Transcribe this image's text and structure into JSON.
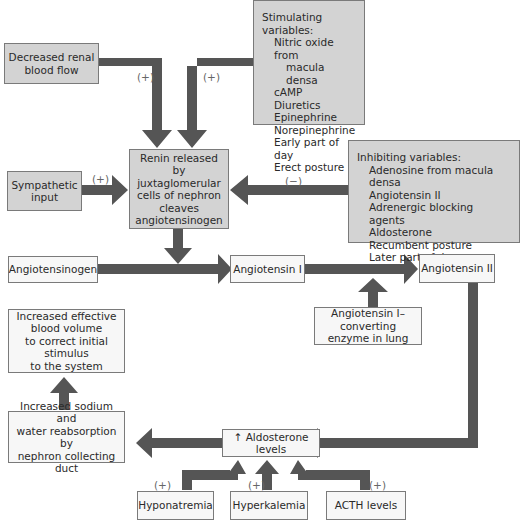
{
  "diagram": {
    "nodes": {
      "decreased_renal_blood_flow": "Decreased renal\nblood flow",
      "stimulating": {
        "heading": "Stimulating variables:",
        "items": [
          "Nitric oxide from",
          "macula densa",
          "cAMP",
          "Diuretics",
          "Epinephrine",
          "Norepinephrine",
          "Early part of day",
          "Erect posture"
        ]
      },
      "sympathetic_input": "Sympathetic\ninput",
      "renin": "Renin released\nby juxtaglomerular\ncells of nephron\ncleaves\nangiotensinogen",
      "inhibiting": {
        "heading": "Inhibiting variables:",
        "items": [
          "Adenosine from macula densa",
          "Angiotensin II",
          "Adrenergic blocking agents",
          "Aldosterone",
          "Recumbent posture",
          "Later part of day"
        ]
      },
      "angiotensinogen": "Angiotensinogen",
      "angiotensin_1": "Angiotensin I",
      "angiotensin_2": "Angiotensin II",
      "ace": "Angiotensin I–converting\nenzyme in lung",
      "increased_blood_volume": "Increased effective\nblood volume\nto correct initial stimulus\nto the system",
      "increased_sodium": "Increased sodium and\nwater reabsorption by\nnephron collecting duct",
      "aldosterone": "↑ Aldosterone levels",
      "hyponatremia": "Hyponatremia",
      "hyperkalemia": "Hyperkalemia",
      "acth": "ACTH levels"
    },
    "labels": {
      "plus": "(+)",
      "minus": "(−)"
    },
    "colors": {
      "arrow": "#555555",
      "box_gray": "#d3d3d3",
      "box_light": "#f7f7f7"
    }
  }
}
